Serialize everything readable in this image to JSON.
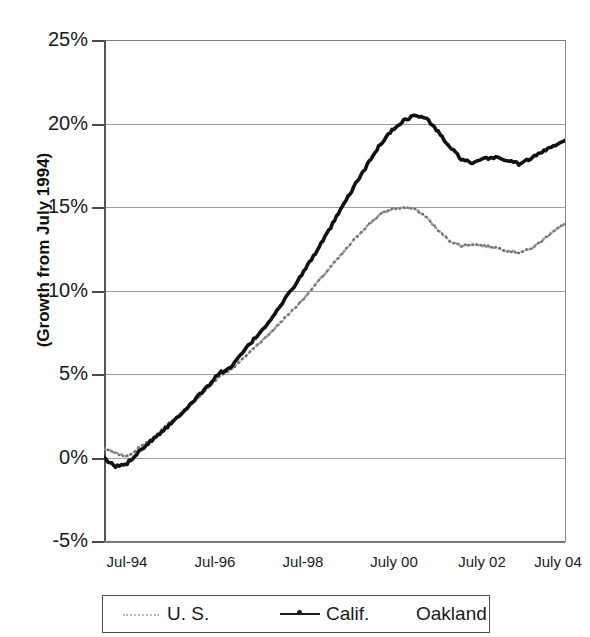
{
  "title": {
    "text": "",
    "note": "cropped-off at top edge of screenshot"
  },
  "axes": {
    "y_axis_title": "(Growth from July 1994)",
    "y_tick_labels": [
      "25%",
      "20%",
      "15%",
      "10%",
      "5%",
      "0%",
      "-5%"
    ],
    "x_tick_labels": [
      "Jul-94",
      "Jul-96",
      "Jul-98",
      "July 00",
      "July 02",
      "July 04"
    ]
  },
  "legend": {
    "items": [
      {
        "label": "U. S.",
        "marker": "dotted-line"
      },
      {
        "label": "Calif.",
        "marker": "solid-line-with-dot"
      },
      {
        "label": "Oakland",
        "marker": "none"
      }
    ]
  },
  "chart_data": {
    "type": "line",
    "title": "",
    "xlabel": "",
    "ylabel": "(Growth from July 1994)",
    "ylim": [
      -5,
      25
    ],
    "xlim": [
      1994.5,
      2004.5
    ],
    "ytick_values": [
      25,
      20,
      15,
      10,
      5,
      0,
      -5
    ],
    "xtick_values": [
      1994.5,
      1996.5,
      1998.5,
      2000.5,
      2002.5,
      2004.5
    ],
    "grid": true,
    "legend_position": "bottom",
    "units": "percent growth from July 1994",
    "series": [
      {
        "name": "Calif.",
        "style": "solid-dark",
        "x": [
          1994.5,
          1994.75,
          1995.0,
          1995.25,
          1995.5,
          1995.75,
          1996.0,
          1996.25,
          1996.5,
          1996.75,
          1997.0,
          1997.25,
          1997.5,
          1997.75,
          1998.0,
          1998.25,
          1998.5,
          1998.75,
          1999.0,
          1999.25,
          1999.5,
          1999.75,
          2000.0,
          2000.25,
          2000.5,
          2000.75,
          2001.0,
          2001.25,
          2001.5,
          2001.75,
          2002.0,
          2002.25,
          2002.5,
          2002.75,
          2003.0,
          2003.25,
          2003.5,
          2003.75,
          2004.0,
          2004.25,
          2004.5
        ],
        "y": [
          0.0,
          -0.5,
          -0.3,
          0.4,
          1.0,
          1.6,
          2.2,
          2.9,
          3.6,
          4.3,
          5.1,
          5.4,
          6.3,
          7.1,
          7.9,
          8.8,
          9.8,
          10.8,
          11.9,
          13.0,
          14.2,
          15.4,
          16.6,
          17.7,
          18.8,
          19.6,
          20.2,
          20.5,
          20.3,
          19.5,
          18.6,
          17.9,
          17.6,
          17.9,
          18.0,
          17.8,
          17.6,
          17.9,
          18.3,
          18.7,
          19.0
        ]
      },
      {
        "name": "U. S.",
        "style": "dotted-light",
        "x": [
          1994.5,
          1994.75,
          1995.0,
          1995.25,
          1995.5,
          1995.75,
          1996.0,
          1996.25,
          1996.5,
          1996.75,
          1997.0,
          1997.25,
          1997.5,
          1997.75,
          1998.0,
          1998.25,
          1998.5,
          1998.75,
          1999.0,
          1999.25,
          1999.5,
          1999.75,
          2000.0,
          2000.25,
          2000.5,
          2000.75,
          2001.0,
          2001.25,
          2001.5,
          2001.75,
          2002.0,
          2002.25,
          2002.5,
          2002.75,
          2003.0,
          2003.25,
          2003.5,
          2003.75,
          2004.0,
          2004.25,
          2004.5
        ],
        "y": [
          0.6,
          0.3,
          0.1,
          0.6,
          1.1,
          1.7,
          2.3,
          2.9,
          3.5,
          4.2,
          4.9,
          5.3,
          5.9,
          6.6,
          7.2,
          7.9,
          8.6,
          9.3,
          10.1,
          10.9,
          11.7,
          12.5,
          13.3,
          14.0,
          14.6,
          14.9,
          15.0,
          14.9,
          14.4,
          13.6,
          13.0,
          12.7,
          12.8,
          12.7,
          12.6,
          12.4,
          12.3,
          12.5,
          13.0,
          13.6,
          14.0
        ]
      }
    ]
  }
}
